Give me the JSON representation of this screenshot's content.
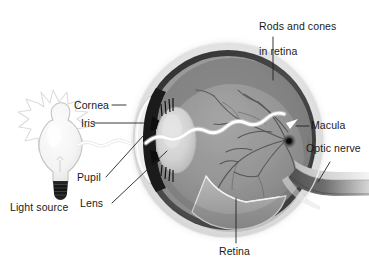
{
  "figure": {
    "background_color": "#ffffff",
    "text_color": "#1a1a1a"
  },
  "labels": {
    "rods_and_cones": "Rods and cones\nin retina",
    "rods_and_cones_line1": "Rods and cones",
    "rods_and_cones_line2": "in retina",
    "cornea": "Cornea",
    "iris": "Iris",
    "pupil": "Pupil",
    "lens": "Lens",
    "light_source": "Light source",
    "macula": "Macula",
    "optic_nerve": "Optic nerve",
    "retina": "Retina"
  },
  "structures": {
    "eyeball": "eyeball-cross-section",
    "sclera": "sclera-outer-layer",
    "choroid": "choroid-dark-layer",
    "retina_layer": "retina-inner-layer",
    "vitreous": "vitreous-humor",
    "lens_body": "crystalline-lens",
    "iris_upper": "iris-upper-wedge",
    "iris_lower": "iris-lower-wedge",
    "cornea_dome": "cornea-dome",
    "macula_spot": "macula-dark-spot",
    "optic_nerve_tube": "optic-nerve-tube",
    "blood_vessels": "retinal-blood-vessels",
    "retina_flap": "retina-cutaway-flap",
    "ciliary_fibers": "ciliary-zonule-fibers",
    "bulb": "light-bulb",
    "bulb_base": "light-bulb-screw-base",
    "bulb_rays": "light-bulb-radiating-rays",
    "light_ray": "wavy-light-ray-to-macula"
  },
  "colors": {
    "sclera_light": "#f2f2f2",
    "sclera_mid": "#d8d8d8",
    "choroid_dark": "#3a3a3a",
    "choroid_darkest": "#141414",
    "vitreous": "#8f8f8f",
    "vitreous_light": "#a8a8a8",
    "lens_fill": "#cfcfcf",
    "ray_white": "#ffffff",
    "vessel": "#5a5a5a",
    "bulb_glass": "#f7f7f7",
    "bulb_outline": "#bcbcbc",
    "base_dark": "#1c1c1c",
    "leader": "#222222"
  },
  "light_ray": {
    "description": "Wavy white beam from bulb through pupil and lens converging on macula",
    "arrow_target": "macula"
  }
}
